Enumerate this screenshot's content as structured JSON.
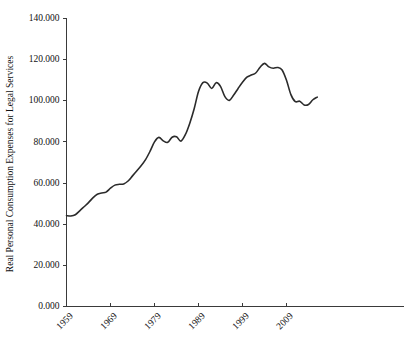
{
  "chart_data": {
    "type": "line",
    "title": "",
    "xlabel": "",
    "ylabel": "Real Personal Consumption Expenses for Legal Services",
    "xlim": [
      1959,
      2016
    ],
    "ylim": [
      0,
      140
    ],
    "grid": false,
    "legend": false,
    "legend_position": "none",
    "line_color": "#2b2b2b",
    "axis_color": "#3a3a3a",
    "background_color": "#ffffff",
    "ytick_labels": [
      "0.000",
      "20.000",
      "40.000",
      "60.000",
      "80.000",
      "100.000",
      "120.000",
      "140.000"
    ],
    "ytick_values": [
      0,
      20,
      40,
      60,
      80,
      100,
      120,
      140
    ],
    "xtick_labels": [
      "1959",
      "1969",
      "1979",
      "1989",
      "1999",
      "2009"
    ],
    "xtick_values": [
      1959,
      1969,
      1979,
      1989,
      1999,
      2009
    ],
    "series": [
      {
        "name": "Real Personal Consumption Expenses for Legal Services",
        "x": [
          1959,
          1960,
          1961,
          1962,
          1963,
          1964,
          1965,
          1966,
          1967,
          1968,
          1969,
          1970,
          1971,
          1972,
          1973,
          1974,
          1975,
          1976,
          1977,
          1978,
          1979,
          1980,
          1981,
          1982,
          1983,
          1984,
          1985,
          1986,
          1987,
          1988,
          1989,
          1990,
          1991,
          1992,
          1993,
          1994,
          1995,
          1996,
          1997,
          1998,
          1999,
          2000,
          2001,
          2002,
          2003,
          2004,
          2005,
          2006,
          2007,
          2008,
          2009,
          2010,
          2011,
          2012,
          2013,
          2014,
          2015,
          2016
        ],
        "values": [
          44.2,
          44.0,
          44.6,
          46.5,
          48.5,
          50.5,
          52.8,
          54.6,
          55.2,
          55.6,
          57.5,
          59.0,
          59.4,
          59.6,
          61.0,
          63.5,
          66.0,
          68.5,
          71.5,
          75.5,
          80.0,
          82.2,
          80.5,
          79.8,
          82.3,
          82.5,
          80.4,
          83.5,
          89.0,
          96.0,
          104.5,
          108.8,
          108.6,
          106.0,
          108.8,
          107.0,
          102.0,
          100.2,
          102.8,
          106.0,
          109.0,
          111.5,
          112.5,
          113.5,
          116.3,
          118.2,
          116.5,
          115.8,
          116.2,
          115.0,
          110.0,
          103.0,
          99.6,
          99.8,
          98.0,
          98.2,
          100.5,
          101.8
        ]
      }
    ]
  },
  "axes": {
    "ylabel": "Real Personal Consumption Expenses for Legal Services"
  }
}
